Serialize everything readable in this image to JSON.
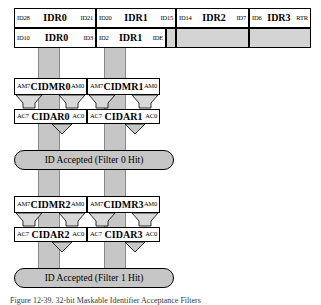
{
  "figure": {
    "caption": "Figure 12-39. 32-bit Maskable Identifier Acceptance Filters"
  },
  "colors": {
    "bar_fill": "#c6c6c6",
    "cell_grey": "#d4d4d4",
    "pill_fill": "#c6c6c6",
    "outline": "#000000"
  },
  "id_registers": {
    "row1": [
      {
        "left": "ID28",
        "name": "IDR0",
        "right": "ID21"
      },
      {
        "left": "ID20",
        "name": "IDR1",
        "right": "ID15"
      },
      {
        "left": "ID14",
        "name": "IDR2",
        "right": "ID7"
      },
      {
        "left": "ID6",
        "name": "IDR3",
        "right": "RTR"
      }
    ],
    "row2": [
      {
        "left": "ID10",
        "name": "IDR0",
        "right": "ID3"
      },
      {
        "left": "ID2",
        "name": "IDR1",
        "right": "IDE"
      },
      {
        "left": "",
        "name": "",
        "right": ""
      },
      {
        "left": "",
        "name": "",
        "right": ""
      },
      {
        "left": "",
        "name": "",
        "right": ""
      }
    ]
  },
  "filter0": {
    "mask_registers": [
      {
        "left": "AM7",
        "name": "CIDMR0",
        "right": "AM0"
      },
      {
        "left": "AM7",
        "name": "CIDMR1",
        "right": "AM0"
      }
    ],
    "accept_registers": [
      {
        "left": "AC7",
        "name": "CIDAR0",
        "right": "AC0"
      },
      {
        "left": "AC7",
        "name": "CIDAR1",
        "right": "AC0"
      }
    ],
    "result": "ID Accepted (Filter 0 Hit)"
  },
  "filter1": {
    "mask_registers": [
      {
        "left": "AM7",
        "name": "CIDMR2",
        "right": "AM0"
      },
      {
        "left": "AM7",
        "name": "CIDMR3",
        "right": "AM0"
      }
    ],
    "accept_registers": [
      {
        "left": "AC7",
        "name": "CIDAR2",
        "right": "AC0"
      },
      {
        "left": "AC7",
        "name": "CIDAR3",
        "right": "AC0"
      }
    ],
    "result": "ID Accepted (Filter 1 Hit)"
  }
}
